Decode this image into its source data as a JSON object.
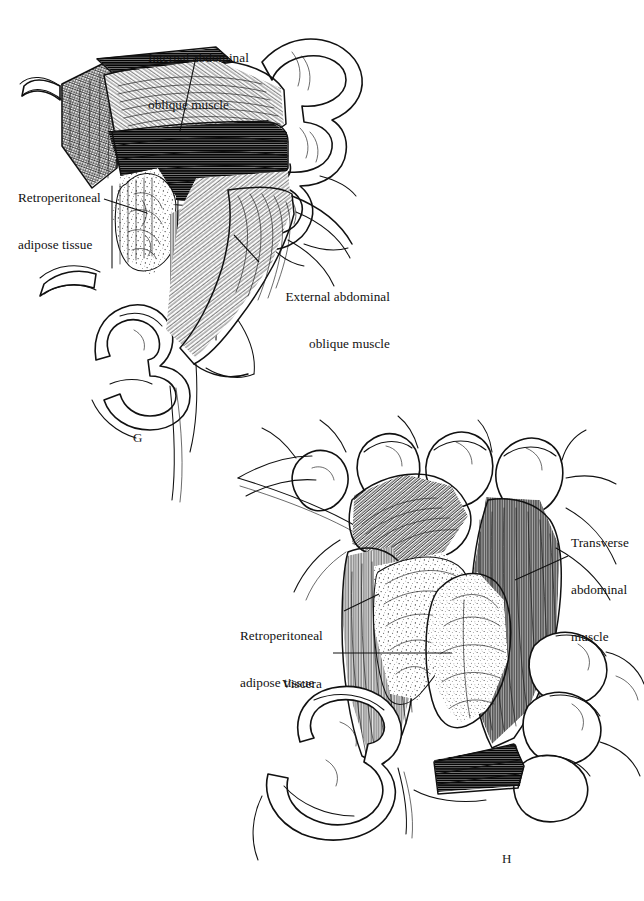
{
  "figure": {
    "background_color": "#ffffff",
    "ink_color": "#111111",
    "width": 644,
    "height": 901
  },
  "panels": [
    {
      "letter": "G",
      "letter_x": 133,
      "letter_y": 430,
      "caption_description": "Upper-left panel: gloved fingers retract the incised abdominal wall, exposing the internal and external abdominal oblique muscles with retroperitoneal adipose tissue in the wound."
    },
    {
      "letter": "H",
      "letter_x": 502,
      "letter_y": 851,
      "caption_description": "Lower-right panel: deeper exposure with both hands spreading the wound, showing the transverse abdominal muscle, retroperitoneal adipose tissue and underlying viscera."
    }
  ],
  "labels": [
    {
      "id": "internal-abdominal-oblique",
      "panel": "G",
      "lines": [
        "Internal abdominal",
        "oblique muscle"
      ],
      "text": "Internal abdominal oblique muscle",
      "x": 148,
      "y": 26,
      "align": "left",
      "leader": {
        "x1": 196,
        "y1": 57,
        "x2": 180,
        "y2": 131
      }
    },
    {
      "id": "retroperitoneal-adipose-tissue-g",
      "panel": "G",
      "lines": [
        "Retroperitoneal",
        "adipose tissue"
      ],
      "text": "Retroperitoneal adipose tissue",
      "x": 18,
      "y": 166,
      "align": "left",
      "leader": {
        "x1": 104,
        "y1": 199,
        "x2": 147,
        "y2": 213
      }
    },
    {
      "id": "external-abdominal-oblique",
      "panel": "G",
      "lines": [
        "External abdominal",
        "oblique muscle"
      ],
      "text": "External abdominal oblique muscle",
      "x": 262,
      "y": 260,
      "align": "right",
      "leader": {
        "x1": 259,
        "y1": 262,
        "x2": 234,
        "y2": 235
      }
    },
    {
      "id": "transverse-abdominal-muscle",
      "panel": "H",
      "lines": [
        "Transverse",
        "abdominal",
        "muscle"
      ],
      "text": "Transverse abdominal muscle",
      "x": 571,
      "y": 509,
      "align": "left",
      "leader": {
        "x1": 568,
        "y1": 556,
        "x2": 515,
        "y2": 580
      }
    },
    {
      "id": "retroperitoneal-adipose-tissue-h",
      "panel": "H",
      "lines": [
        "Retroperitoneal",
        "adipose tissue"
      ],
      "text": "Retroperitoneal adipose tissue",
      "x": 240,
      "y": 600,
      "align": "left",
      "leader": {
        "x1": 344,
        "y1": 611,
        "x2": 379,
        "y2": 594
      }
    },
    {
      "id": "viscera",
      "panel": "H",
      "lines": [
        "Viscera"
      ],
      "text": "Viscera",
      "x": 282,
      "y": 645,
      "align": "left",
      "leader": {
        "x1": 333,
        "y1": 653,
        "x2": 452,
        "y2": 653
      }
    }
  ],
  "anatomy_features": [
    {
      "id": "internal-oblique-muscle-belly",
      "panel": "G",
      "kind": "muscle",
      "shading": "fine-parallel-hatching"
    },
    {
      "id": "external-oblique-muscle-sheet",
      "panel": "G",
      "kind": "muscle",
      "shading": "diagonal-hatching"
    },
    {
      "id": "cut-skin-edge",
      "panel": "G",
      "kind": "skin-edge",
      "shading": "cross-hatched-rim"
    },
    {
      "id": "retroperitoneal-fat-mass",
      "panel": "G",
      "kind": "adipose",
      "shading": "stippled-lobules"
    },
    {
      "id": "transverse-abdominal-muscle-sheet",
      "panel": "H",
      "kind": "muscle",
      "shading": "vertical-hatching"
    },
    {
      "id": "internal-oblique-flap",
      "panel": "H",
      "kind": "muscle",
      "shading": "oblique-hatching"
    },
    {
      "id": "viscera-bulge",
      "panel": "H",
      "kind": "viscera",
      "shading": "dense-stipple"
    },
    {
      "id": "retroperitoneal-fat-sheet",
      "panel": "H",
      "kind": "adipose",
      "shading": "stippled"
    },
    {
      "id": "surgeon-hand-left",
      "panel": "G",
      "kind": "hand",
      "shading": "outline"
    },
    {
      "id": "surgeon-hand-right",
      "panel": "G",
      "kind": "hand",
      "shading": "outline"
    },
    {
      "id": "surgeon-hand-upper",
      "panel": "H",
      "kind": "hand",
      "shading": "outline"
    },
    {
      "id": "surgeon-hand-lower",
      "panel": "H",
      "kind": "hand",
      "shading": "outline"
    }
  ]
}
